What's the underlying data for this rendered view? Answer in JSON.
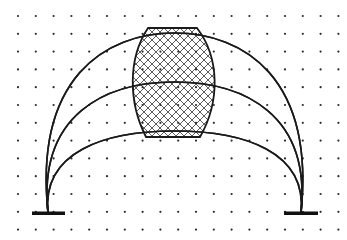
{
  "diagram": {
    "grid": {
      "x_start": 18,
      "y_start": 16,
      "spacing_x": 17.8,
      "spacing_y": 17.8,
      "cols": 19,
      "rows": 13,
      "dot_color": "#2a2a2a"
    },
    "arches": [
      {
        "name": "outer-arch",
        "left_anchor": [
          48,
          213
        ],
        "right_anchor": [
          301,
          213
        ],
        "apex_y": 33
      },
      {
        "name": "middle-arch",
        "left_anchor": [
          48,
          213
        ],
        "right_anchor": [
          301,
          213
        ],
        "apex_y": 82
      },
      {
        "name": "inner-arch",
        "left_anchor": [
          48,
          213
        ],
        "right_anchor": [
          301,
          213
        ],
        "apex_y": 131
      }
    ],
    "bases": [
      {
        "name": "left-base",
        "x1": 32,
        "x2": 65,
        "y": 213
      },
      {
        "name": "right-base",
        "x1": 284,
        "x2": 318,
        "y": 213
      }
    ],
    "barrel": {
      "top": {
        "x1": 148,
        "x2": 197,
        "y": 28
      },
      "bottom": {
        "x1": 146,
        "x2": 200,
        "y": 137
      },
      "max_bulge": {
        "left_x": 132,
        "right_x": 216,
        "y": 82
      },
      "fill": "cross-hatch",
      "hatch_spacing": 8
    },
    "stroke_color": "#1a1a1a"
  }
}
